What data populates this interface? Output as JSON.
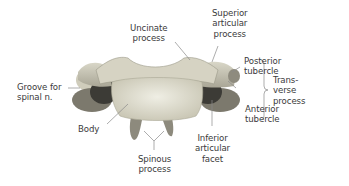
{
  "figure": {
    "labels": {
      "uncinate_process": "Uncinate\nprocess",
      "superior_articular_process": "Superior\narticular\nprocess",
      "posterior_tubercle": "Posterior\ntubercle",
      "anterior_tubercle": "Anterior\ntubercle",
      "transverse_process": "Trans-\nverse\nprocess",
      "groove_for_spinal_nerve": "Groove for\nspinal n.",
      "body": "Body",
      "inferior_articular_facet": "Inferior\narticular\nfacet",
      "spinous_process": "Spinous\nprocess"
    },
    "colors": {
      "bone_light": "#e6e4d6",
      "bone_mid": "#bdbaa8",
      "bone_dark": "#6f6d63",
      "leader_line": "#8a8a8a",
      "text": "#3a3a3a"
    }
  }
}
